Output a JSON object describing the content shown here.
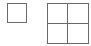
{
  "icons": [
    {
      "name": "single-window-layout-icon",
      "type": "layout",
      "panes": 1
    },
    {
      "name": "quad-grid-layout-icon",
      "type": "layout",
      "panes": 4,
      "rows": 2,
      "columns": 2
    }
  ],
  "colors": {
    "stroke": "#6a6a6a",
    "background": "#ffffff"
  }
}
